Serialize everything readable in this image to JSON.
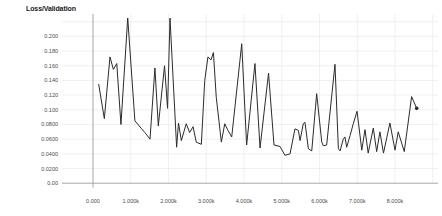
{
  "title": "Loss/Validation",
  "colors": {
    "background": "#ffffff",
    "grid_light": "#e9e9e9",
    "grid_zero": "#9e9e9e",
    "tick_label": "#4a4a4a",
    "title_text": "#1a1a1a",
    "series_line": "#2b2b2b"
  },
  "chart_data": {
    "type": "line",
    "title": "Loss/Validation",
    "xlabel": "",
    "ylabel": "",
    "grid": true,
    "legend": null,
    "x_unit": "steps",
    "ylim": [
      0,
      0.232
    ],
    "xlim_steps": [
      -820,
      9140
    ],
    "x_ticks": [
      {
        "step": 0,
        "label": "0.000"
      },
      {
        "step": 1000,
        "label": "1.000k"
      },
      {
        "step": 2000,
        "label": "2.000k"
      },
      {
        "step": 3000,
        "label": "3.000k"
      },
      {
        "step": 4000,
        "label": "4.000k"
      },
      {
        "step": 5000,
        "label": "5.000k"
      },
      {
        "step": 6000,
        "label": "6.000k"
      },
      {
        "step": 7000,
        "label": "7.000k"
      },
      {
        "step": 8000,
        "label": "8.000k"
      }
    ],
    "x_gridlines_unlabeled_steps": [
      9000
    ],
    "y_ticks": [
      {
        "value": 0.0,
        "label": "0.00"
      },
      {
        "value": 0.02,
        "label": "0.0200"
      },
      {
        "value": 0.04,
        "label": "0.0400"
      },
      {
        "value": 0.06,
        "label": "0.0600"
      },
      {
        "value": 0.08,
        "label": "0.0800"
      },
      {
        "value": 0.1,
        "label": "0.100"
      },
      {
        "value": 0.12,
        "label": "0.120"
      },
      {
        "value": 0.14,
        "label": "0.140"
      },
      {
        "value": 0.16,
        "label": "0.160"
      },
      {
        "value": 0.18,
        "label": "0.180"
      },
      {
        "value": 0.2,
        "label": "0.200"
      }
    ],
    "y_gridlines_unlabeled_values": [
      0.22
    ],
    "series": [
      {
        "name": "validation-loss",
        "color": "#2b2b2b",
        "end_marker": true,
        "points": [
          [
            150,
            0.135
          ],
          [
            300,
            0.088
          ],
          [
            450,
            0.172
          ],
          [
            540,
            0.155
          ],
          [
            630,
            0.163
          ],
          [
            740,
            0.08
          ],
          [
            920,
            0.225
          ],
          [
            1110,
            0.085
          ],
          [
            1290,
            0.074
          ],
          [
            1375,
            0.069
          ],
          [
            1510,
            0.06
          ],
          [
            1640,
            0.157
          ],
          [
            1730,
            0.078
          ],
          [
            1895,
            0.16
          ],
          [
            1975,
            0.102
          ],
          [
            2040,
            0.225
          ],
          [
            2215,
            0.049
          ],
          [
            2265,
            0.082
          ],
          [
            2340,
            0.058
          ],
          [
            2470,
            0.081
          ],
          [
            2560,
            0.069
          ],
          [
            2650,
            0.077
          ],
          [
            2735,
            0.056
          ],
          [
            2870,
            0.053
          ],
          [
            2960,
            0.14
          ],
          [
            3045,
            0.172
          ],
          [
            3125,
            0.168
          ],
          [
            3190,
            0.178
          ],
          [
            3265,
            0.117
          ],
          [
            3400,
            0.056
          ],
          [
            3490,
            0.081
          ],
          [
            3575,
            0.072
          ],
          [
            3675,
            0.063
          ],
          [
            3940,
            0.19
          ],
          [
            4070,
            0.052
          ],
          [
            4290,
            0.163
          ],
          [
            4425,
            0.048
          ],
          [
            4650,
            0.15
          ],
          [
            4795,
            0.052
          ],
          [
            4955,
            0.05
          ],
          [
            5085,
            0.038
          ],
          [
            5220,
            0.04
          ],
          [
            5350,
            0.074
          ],
          [
            5440,
            0.072
          ],
          [
            5485,
            0.058
          ],
          [
            5570,
            0.081
          ],
          [
            5615,
            0.083
          ],
          [
            5705,
            0.047
          ],
          [
            5795,
            0.044
          ],
          [
            5925,
            0.122
          ],
          [
            6060,
            0.056
          ],
          [
            6100,
            0.051
          ],
          [
            6190,
            0.052
          ],
          [
            6410,
            0.162
          ],
          [
            6500,
            0.047
          ],
          [
            6545,
            0.044
          ],
          [
            6630,
            0.06
          ],
          [
            6675,
            0.063
          ],
          [
            6720,
            0.049
          ],
          [
            6810,
            0.065
          ],
          [
            6895,
            0.081
          ],
          [
            6995,
            0.098
          ],
          [
            7120,
            0.045
          ],
          [
            7205,
            0.073
          ],
          [
            7290,
            0.041
          ],
          [
            7425,
            0.075
          ],
          [
            7515,
            0.043
          ],
          [
            7600,
            0.07
          ],
          [
            7695,
            0.041
          ],
          [
            7865,
            0.082
          ],
          [
            8000,
            0.045
          ],
          [
            8085,
            0.07
          ],
          [
            8245,
            0.043
          ],
          [
            8440,
            0.118
          ],
          [
            8575,
            0.102
          ]
        ]
      }
    ]
  }
}
